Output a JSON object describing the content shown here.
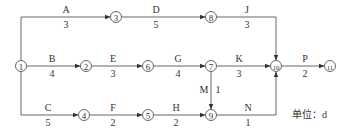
{
  "diagram": {
    "type": "activity-on-arrow network",
    "unit_label": "单位：d",
    "nodes": [
      {
        "id": "1",
        "label": "①",
        "x": 21,
        "y": 66
      },
      {
        "id": "2",
        "label": "②",
        "x": 86,
        "y": 66
      },
      {
        "id": "3",
        "label": "③",
        "x": 116,
        "y": 17
      },
      {
        "id": "4",
        "label": "④",
        "x": 84,
        "y": 115
      },
      {
        "id": "5",
        "label": "⑤",
        "x": 148,
        "y": 115
      },
      {
        "id": "6",
        "label": "⑥",
        "x": 148,
        "y": 66
      },
      {
        "id": "7",
        "label": "⑦",
        "x": 211,
        "y": 66
      },
      {
        "id": "8",
        "label": "⑧",
        "x": 211,
        "y": 17
      },
      {
        "id": "9",
        "label": "⑨",
        "x": 211,
        "y": 115
      },
      {
        "id": "10",
        "label": "⑩",
        "x": 276,
        "y": 66
      },
      {
        "id": "11",
        "label": "⑪",
        "x": 330,
        "y": 66
      }
    ],
    "activities": [
      {
        "name": "A",
        "duration": "3",
        "from": "1",
        "to": "3"
      },
      {
        "name": "D",
        "duration": "5",
        "from": "3",
        "to": "8"
      },
      {
        "name": "J",
        "duration": "3",
        "from": "8",
        "to": "10"
      },
      {
        "name": "B",
        "duration": "4",
        "from": "1",
        "to": "2"
      },
      {
        "name": "E",
        "duration": "3",
        "from": "2",
        "to": "6"
      },
      {
        "name": "G",
        "duration": "4",
        "from": "6",
        "to": "7"
      },
      {
        "name": "K",
        "duration": "3",
        "from": "7",
        "to": "10"
      },
      {
        "name": "P",
        "duration": "2",
        "from": "10",
        "to": "11"
      },
      {
        "name": "C",
        "duration": "5",
        "from": "1",
        "to": "4"
      },
      {
        "name": "F",
        "duration": "2",
        "from": "4",
        "to": "5"
      },
      {
        "name": "H",
        "duration": "2",
        "from": "5",
        "to": "9"
      },
      {
        "name": "N",
        "duration": "1",
        "from": "9",
        "to": "10"
      },
      {
        "name": "M",
        "duration": "1",
        "from": "7",
        "to": "9"
      }
    ]
  }
}
